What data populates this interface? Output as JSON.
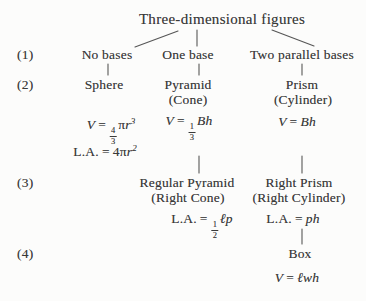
{
  "palette": {
    "background": "#fcfcfb",
    "text_color": "#3a3a3a",
    "connector_color": "#565656"
  },
  "diagram": {
    "title": "Three-dimensional figures",
    "row_markers": {
      "r1": "(1)",
      "r2": "(2)",
      "r3": "(3)",
      "r4": "(4)"
    },
    "level1": {
      "no_bases": "No bases",
      "one_base": "One base",
      "two_parallel_bases": "Two parallel bases"
    },
    "level2": {
      "sphere": "Sphere",
      "pyramid": "Pyramid",
      "pyramid_alt": "(Cone)",
      "prism": "Prism",
      "prism_alt": "(Cylinder)"
    },
    "level3": {
      "regular_pyramid": "Regular Pyramid",
      "regular_pyramid_alt": "(Right Cone)",
      "right_prism": "Right Prism",
      "right_prism_alt": "(Right Cylinder)"
    },
    "level4": {
      "box": "Box"
    },
    "formulas": {
      "sphere_volume": {
        "lhs": "V",
        "eq": "=",
        "frac_num": "4",
        "frac_den": "3",
        "pi": "π",
        "rhs": "r",
        "sup": "3"
      },
      "sphere_lateral_area": {
        "lhs": "L.A.",
        "eq": "=",
        "coef": "4",
        "pi": "π",
        "rhs": "r",
        "sup": "2"
      },
      "pyramid_volume": {
        "lhs": "V",
        "eq": "=",
        "frac_num": "1",
        "frac_den": "3",
        "rhs": "Bh"
      },
      "prism_volume": {
        "lhs": "V",
        "eq": "=",
        "rhs": "Bh"
      },
      "regular_pyramid_lateral_area": {
        "lhs": "L.A.",
        "eq": "=",
        "frac_num": "1",
        "frac_den": "2",
        "rhs": "ℓp"
      },
      "right_prism_lateral_area": {
        "lhs": "L.A.",
        "eq": "=",
        "rhs": "ph"
      },
      "box_volume": {
        "lhs": "V",
        "eq": "=",
        "rhs": "ℓwh"
      }
    }
  }
}
